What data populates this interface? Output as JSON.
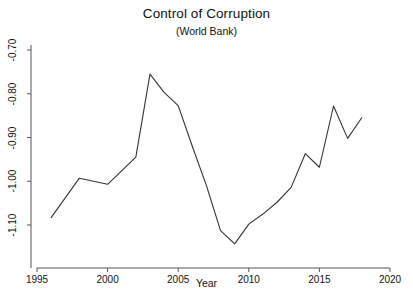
{
  "chart_data": {
    "type": "line",
    "title": "Control of Corruption",
    "subtitle": "(World Bank)",
    "xlabel": "Year",
    "ylabel": "",
    "xlim": [
      1995,
      2020
    ],
    "ylim": [
      -1.1,
      -0.7
    ],
    "grid": false,
    "legend": null,
    "xticks": [
      1995,
      2000,
      2005,
      2010,
      2015,
      2020
    ],
    "xtick_labels": [
      "1995",
      "2000",
      "2005",
      "2010",
      "2015",
      "2020"
    ],
    "yticks": [
      -0.7,
      -0.8,
      -0.9,
      -1.0,
      -1.1
    ],
    "ytick_labels": [
      "-0.70",
      "-0.80",
      "-0.90",
      "-1.00",
      "-1.10"
    ],
    "line_color": "#333333",
    "x": [
      1996,
      1998,
      2000,
      2002,
      2003,
      2004,
      2005,
      2006,
      2007,
      2008,
      2009,
      2010,
      2011,
      2012,
      2013,
      2014,
      2015,
      2016,
      2017,
      2018
    ],
    "values": [
      -1.083,
      -0.993,
      -1.007,
      -0.945,
      -0.755,
      -0.797,
      -0.827,
      -0.92,
      -1.01,
      -1.113,
      -1.143,
      -1.098,
      -1.075,
      -1.048,
      -1.014,
      -0.937,
      -0.968,
      -0.828,
      -0.902,
      -0.855
    ],
    "series": [
      {
        "name": "Control of Corruption",
        "x": [
          1996,
          1998,
          2000,
          2002,
          2003,
          2004,
          2005,
          2006,
          2007,
          2008,
          2009,
          2010,
          2011,
          2012,
          2013,
          2014,
          2015,
          2016,
          2017,
          2018
        ],
        "values": [
          -1.083,
          -0.993,
          -1.007,
          -0.945,
          -0.755,
          -0.797,
          -0.827,
          -0.92,
          -1.01,
          -1.113,
          -1.143,
          -1.098,
          -1.075,
          -1.048,
          -1.014,
          -0.937,
          -0.968,
          -0.828,
          -0.902,
          -0.855
        ]
      }
    ]
  }
}
